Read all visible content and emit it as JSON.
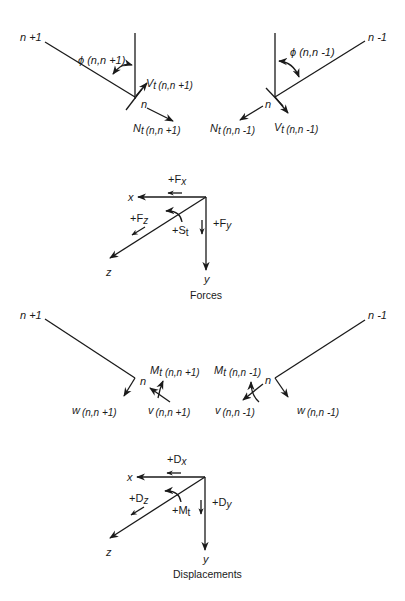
{
  "forces_diagram": {
    "left_member": {
      "far_node": "n +1",
      "node": "n",
      "angle_label": "ϕ (n,n +1)",
      "shear_label_main": "V",
      "shear_label_sub": "t",
      "shear_label_args": "(n,n +1)",
      "normal_label_main": "N",
      "normal_label_sub": "t",
      "normal_label_args": "(n,n +1)"
    },
    "right_member": {
      "far_node": "n -1",
      "node": "n",
      "angle_label": "ϕ (n,n -1)",
      "shear_label_main": "V",
      "shear_label_sub": "t",
      "shear_label_args": "(n,n -1)",
      "normal_label_main": "N",
      "normal_label_sub": "t",
      "normal_label_args": "(n,n -1)"
    },
    "axes": {
      "x": "x",
      "y": "y",
      "z": "z",
      "fx": "+F",
      "fx_sub": "x",
      "fy": "+F",
      "fy_sub": "y",
      "fz": "+F",
      "fz_sub": "z",
      "moment": "+S",
      "moment_sub": "t"
    },
    "caption": "Forces"
  },
  "displacements_diagram": {
    "left_member": {
      "far_node": "n +1",
      "node": "n",
      "moment_main": "M",
      "moment_sub": "t",
      "moment_args": "(n,n +1)",
      "w_label": "w",
      "w_args": "(n,n +1)",
      "v_label": "v",
      "v_args": "(n,n +1)"
    },
    "right_member": {
      "far_node": "n -1",
      "node": "n",
      "moment_main": "M",
      "moment_sub": "t",
      "moment_args": "(n,n -1)",
      "w_label": "w",
      "w_args": "(n,n -1)",
      "v_label": "v",
      "v_args": "(n,n -1)"
    },
    "axes": {
      "x": "x",
      "y": "y",
      "z": "z",
      "dx": "+D",
      "dx_sub": "x",
      "dy": "+D",
      "dy_sub": "y",
      "dz": "+D",
      "dz_sub": "z",
      "moment": "+M",
      "moment_sub": "t"
    },
    "caption": "Displacements"
  },
  "colors": {
    "ink": "#1a1a1a",
    "background": "#ffffff"
  }
}
